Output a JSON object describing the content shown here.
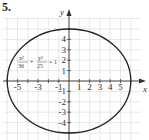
{
  "problem": {
    "number": "5."
  },
  "chart_data": {
    "type": "line",
    "title": "",
    "equation": "x²/36 + y²/25 = 1",
    "equation_parts": {
      "x_num": "x²",
      "x_den": "36",
      "plus": "+",
      "y_num": "y²",
      "y_den": "25",
      "rhs": "= 1"
    },
    "xlabel": "x",
    "ylabel": "y",
    "xlim": [
      -6.5,
      7
    ],
    "ylim": [
      -5.5,
      6
    ],
    "grid": true,
    "x_tick_labels": [
      "-5",
      "-3",
      "-1",
      "1",
      "2",
      "3",
      "4",
      "5"
    ],
    "x_tick_values": [
      -5,
      -3,
      -1,
      1,
      2,
      3,
      4,
      5
    ],
    "y_tick_labels": [
      "4",
      "3",
      "2",
      "1",
      "-1",
      "-2",
      "-3",
      "-4"
    ],
    "y_tick_values": [
      4,
      3,
      2,
      1,
      -1,
      -2,
      -3,
      -4
    ],
    "series": [
      {
        "name": "ellipse",
        "shape": "ellipse",
        "center": [
          0,
          0
        ],
        "semi_major_x": 6,
        "semi_minor_y": 5
      }
    ],
    "style": {
      "curve_color": "#222222",
      "grid_color": "#d9d9d9",
      "axis_color": "#333333"
    }
  }
}
